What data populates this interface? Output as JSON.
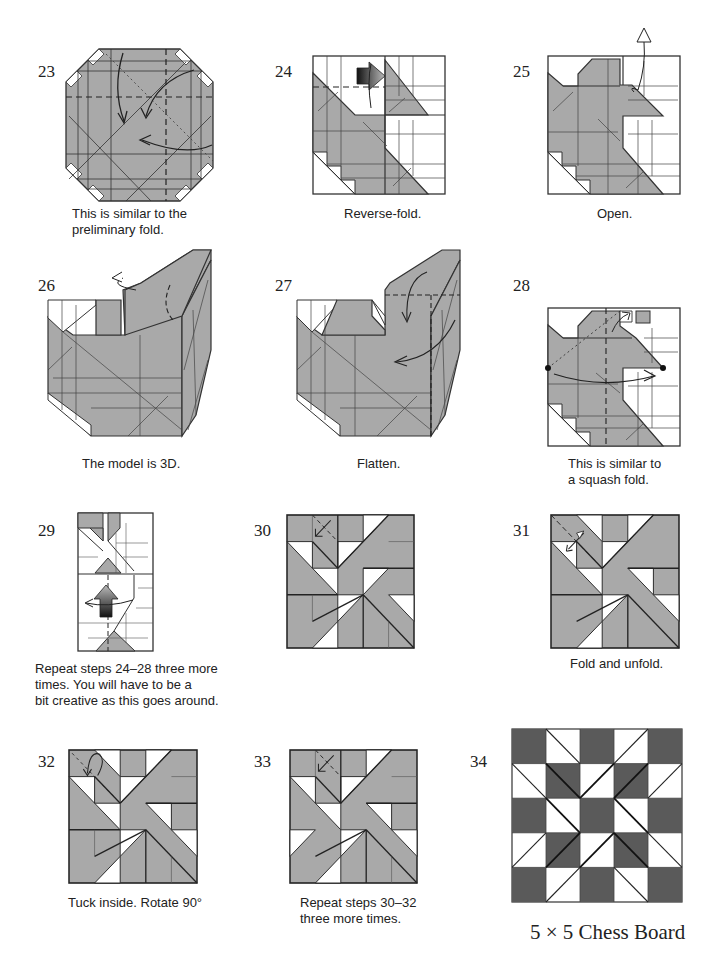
{
  "page": {
    "colors": {
      "paper_gray": "#a9a9a9",
      "dark_gray": "#5a5a5a",
      "line": "#222222",
      "white": "#ffffff"
    }
  },
  "steps": [
    {
      "number": "23",
      "caption_lines": [
        "This is similar to the",
        "preliminary fold."
      ]
    },
    {
      "number": "24",
      "caption_lines": [
        "Reverse-fold."
      ]
    },
    {
      "number": "25",
      "caption_lines": [
        "Open."
      ]
    },
    {
      "number": "26",
      "caption_lines": [
        "The model is 3D."
      ]
    },
    {
      "number": "27",
      "caption_lines": [
        "Flatten."
      ]
    },
    {
      "number": "28",
      "caption_lines": [
        "This is similar to",
        "a squash fold."
      ]
    },
    {
      "number": "29",
      "caption_lines": [
        "Repeat steps 24–28 three more",
        "times. You will have to be a",
        "bit creative as this goes around."
      ]
    },
    {
      "number": "30",
      "caption_lines": []
    },
    {
      "number": "31",
      "caption_lines": [
        "Fold and unfold."
      ]
    },
    {
      "number": "32",
      "caption_lines": [
        "Tuck inside. Rotate 90°"
      ]
    },
    {
      "number": "33",
      "caption_lines": [
        "Repeat steps 30–32",
        "three more times."
      ]
    },
    {
      "number": "34",
      "caption_lines": [],
      "title": "5 × 5 Chess Board"
    }
  ],
  "icons": {
    "fold_arrow": "curved-arrow",
    "push_arrow": "hollow-push-arrow",
    "reverse_fold_arrow": "gradient-reverse-fold-arrow",
    "fold_unfold_arrow": "double-headed-arrow",
    "reference_dot": "dot-marker"
  }
}
